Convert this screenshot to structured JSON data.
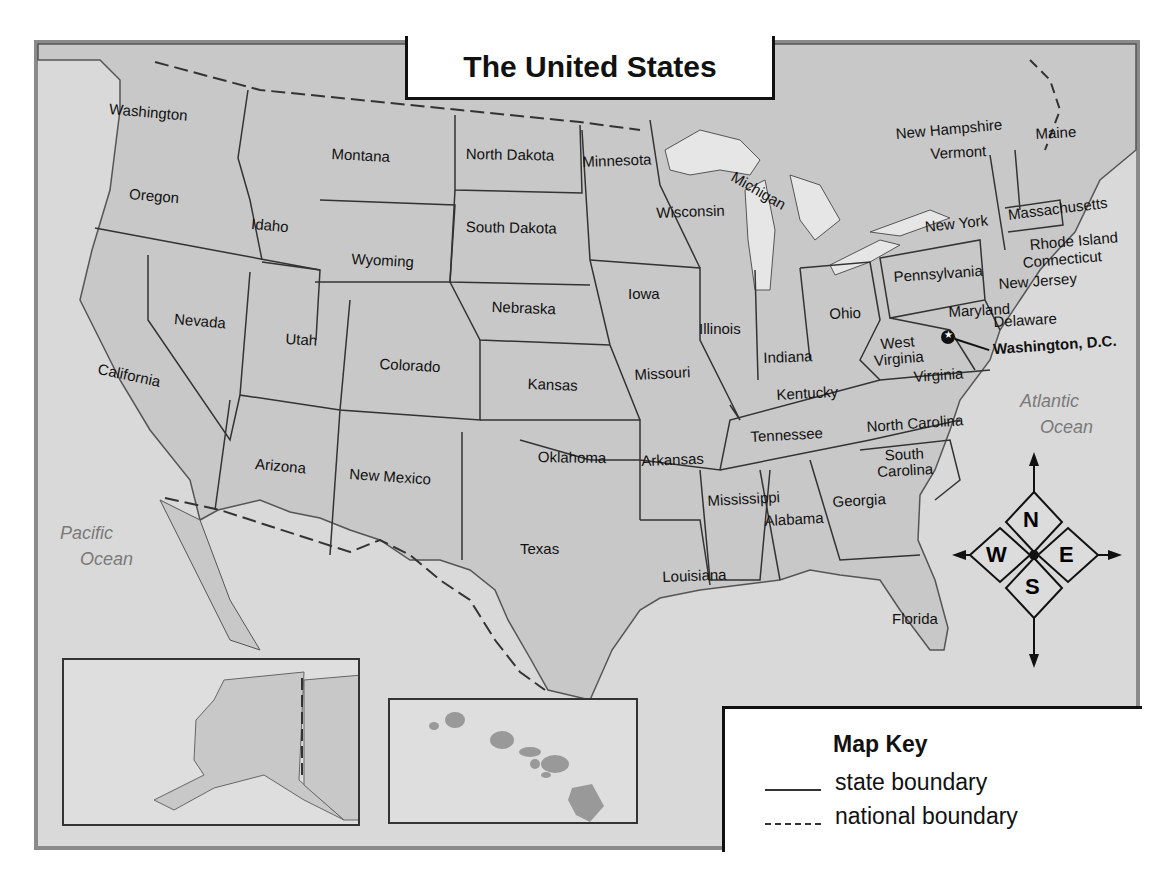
{
  "title": "The United States",
  "colors": {
    "land": "#c8c8c8",
    "water": "#e6e6e6",
    "frame_border": "#8a8a8a",
    "boundary": "#333333",
    "ocean_label": "#7a7a7a"
  },
  "states": [
    {
      "name": "Washington",
      "x": 110,
      "y": 100,
      "rot": 5
    },
    {
      "name": "Oregon",
      "x": 130,
      "y": 185,
      "rot": 5
    },
    {
      "name": "California",
      "x": 100,
      "y": 360,
      "rot": 12
    },
    {
      "name": "Idaho",
      "x": 252,
      "y": 215,
      "rot": 5
    },
    {
      "name": "Nevada",
      "x": 175,
      "y": 310,
      "rot": 5
    },
    {
      "name": "Montana",
      "x": 332,
      "y": 145,
      "rot": 3
    },
    {
      "name": "Wyoming",
      "x": 352,
      "y": 250,
      "rot": 3
    },
    {
      "name": "Utah",
      "x": 286,
      "y": 330,
      "rot": 3
    },
    {
      "name": "Colorado",
      "x": 380,
      "y": 355,
      "rot": 3
    },
    {
      "name": "Arizona",
      "x": 256,
      "y": 455,
      "rot": 5
    },
    {
      "name": "New Mexico",
      "x": 350,
      "y": 465,
      "rot": 4
    },
    {
      "name": "North Dakota",
      "x": 466,
      "y": 145,
      "rot": 1
    },
    {
      "name": "South Dakota",
      "x": 466,
      "y": 218,
      "rot": 1
    },
    {
      "name": "Nebraska",
      "x": 492,
      "y": 298,
      "rot": 2
    },
    {
      "name": "Kansas",
      "x": 528,
      "y": 375,
      "rot": 2
    },
    {
      "name": "Oklahoma",
      "x": 538,
      "y": 448,
      "rot": 1
    },
    {
      "name": "Texas",
      "x": 520,
      "y": 540,
      "rot": 0
    },
    {
      "name": "Minnesota",
      "x": 582,
      "y": 153,
      "rot": -2
    },
    {
      "name": "Iowa",
      "x": 628,
      "y": 285,
      "rot": 0
    },
    {
      "name": "Missouri",
      "x": 634,
      "y": 366,
      "rot": -3
    },
    {
      "name": "Arkansas",
      "x": 641,
      "y": 452,
      "rot": -2
    },
    {
      "name": "Louisiana",
      "x": 662,
      "y": 568,
      "rot": -2
    },
    {
      "name": "Wisconsin",
      "x": 656,
      "y": 204,
      "rot": -2
    },
    {
      "name": "Michigan",
      "x": 737,
      "y": 168,
      "rot": 30
    },
    {
      "name": "Illinois",
      "x": 699,
      "y": 320,
      "rot": 0
    },
    {
      "name": "Indiana",
      "x": 763,
      "y": 349,
      "rot": -2
    },
    {
      "name": "Ohio",
      "x": 829,
      "y": 305,
      "rot": -2
    },
    {
      "name": "Kentucky",
      "x": 776,
      "y": 386,
      "rot": -3
    },
    {
      "name": "Tennessee",
      "x": 750,
      "y": 428,
      "rot": -3
    },
    {
      "name": "Mississippi",
      "x": 707,
      "y": 492,
      "rot": -3
    },
    {
      "name": "Alabama",
      "x": 764,
      "y": 512,
      "rot": -3
    },
    {
      "name": "Georgia",
      "x": 832,
      "y": 493,
      "rot": -3
    },
    {
      "name": "Florida",
      "x": 892,
      "y": 610,
      "rot": 0
    },
    {
      "name": "South Carolina",
      "x": 876,
      "y": 448,
      "rot": -3,
      "multiline": [
        "South",
        "Carolina"
      ]
    },
    {
      "name": "North Carolina",
      "x": 866,
      "y": 418,
      "rot": -4
    },
    {
      "name": "Virginia",
      "x": 913,
      "y": 368,
      "rot": -4
    },
    {
      "name": "West Virginia",
      "x": 872,
      "y": 337,
      "rot": -5,
      "multiline": [
        "West",
        "Virginia"
      ]
    },
    {
      "name": "Pennsylvania",
      "x": 893,
      "y": 268,
      "rot": -4
    },
    {
      "name": "New York",
      "x": 924,
      "y": 218,
      "rot": -6
    },
    {
      "name": "Maryland",
      "x": 948,
      "y": 303,
      "rot": -3
    },
    {
      "name": "Delaware",
      "x": 993,
      "y": 313,
      "rot": -3
    },
    {
      "name": "New Jersey",
      "x": 998,
      "y": 275,
      "rot": -4
    },
    {
      "name": "Connecticut",
      "x": 1022,
      "y": 254,
      "rot": -5
    },
    {
      "name": "Rhode Island",
      "x": 1029,
      "y": 236,
      "rot": -5
    },
    {
      "name": "Massachusetts",
      "x": 1007,
      "y": 206,
      "rot": -7
    },
    {
      "name": "Vermont",
      "x": 930,
      "y": 145,
      "rot": -3
    },
    {
      "name": "New Hampshire",
      "x": 895,
      "y": 125,
      "rot": -5
    },
    {
      "name": "Maine",
      "x": 1035,
      "y": 125,
      "rot": -3
    },
    {
      "name": "Alaska",
      "x": 238,
      "y": 688,
      "rot": 0
    },
    {
      "name": "Hawaii",
      "x": 524,
      "y": 700,
      "rot": 0
    }
  ],
  "capital": {
    "name": "Washington, D.C.",
    "x": 993,
    "y": 336
  },
  "oceans": [
    {
      "name": "Pacific Ocean",
      "lines": [
        "Pacific",
        "Ocean"
      ],
      "x": 60,
      "y": 520,
      "size": "large"
    },
    {
      "name": "Atlantic Ocean",
      "lines": [
        "Atlantic",
        "Ocean"
      ],
      "x": 1020,
      "y": 388,
      "size": "large"
    },
    {
      "name": "Arctic Ocean",
      "lines": [
        "Arctic",
        "Ocean"
      ],
      "x": 105,
      "y": 716,
      "size": "small"
    },
    {
      "name": "Pacific Ocean (Hawaii inset)",
      "lines": [
        "Pacific",
        "Ocean"
      ],
      "x": 436,
      "y": 778,
      "size": "small"
    }
  ],
  "compass": {
    "north": "N",
    "south": "S",
    "east": "E",
    "west": "W"
  },
  "map_key": {
    "title": "Map Key",
    "items": [
      {
        "style": "solid",
        "label": "state boundary"
      },
      {
        "style": "dashed",
        "label": "national boundary"
      }
    ]
  },
  "insets": [
    {
      "name": "Alaska inset",
      "x": 62,
      "y": 658,
      "w": 298,
      "h": 168
    },
    {
      "name": "Hawaii inset",
      "x": 388,
      "y": 698,
      "w": 250,
      "h": 126
    }
  ]
}
